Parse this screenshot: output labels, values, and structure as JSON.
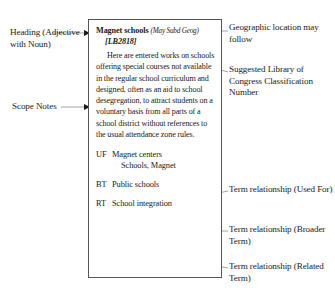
{
  "diagram": {
    "record": {
      "heading_term": "Magnet schools",
      "heading_subdivision": "(May Subd Geog)",
      "classification_number": "[LB2818]",
      "scope_note": "Here are entered works on schools offering special courses not available in the regular school curriculum and designed, often as an aid to school desegregation, to attract students on a voluntary basis from all parts of a school district without references to the usual attendance zone rules.",
      "cross_references": [
        {
          "code": "UF",
          "terms": [
            "Magnet centers",
            "Schools, Magnet"
          ]
        },
        {
          "code": "BT",
          "terms": [
            "Public schools"
          ]
        },
        {
          "code": "RT",
          "terms": [
            "School integration"
          ]
        }
      ]
    },
    "callouts": {
      "heading": "Heading (Adjective with Noun)",
      "scope_notes": "Scope Notes",
      "geographic": "Geographic location may follow",
      "classification": "Suggested Library of Congress Classification Number",
      "used_for": "Term relationship (Used For)",
      "broader_term": "Term relationship (Broader Term)",
      "related_term": "Term relationship (Related Term)"
    },
    "colors": {
      "box_border": "#55555a",
      "leader_line": "#8a8a90",
      "text": "#1a1a1a",
      "background": "#ffffff"
    }
  }
}
